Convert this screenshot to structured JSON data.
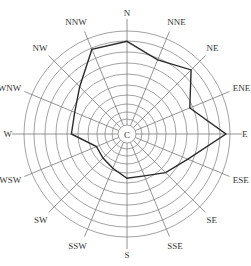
{
  "chart_data": {
    "type": "radar",
    "title": "",
    "subtype": "wind rose",
    "center_label": "C",
    "categories": [
      "N",
      "NNE",
      "NE",
      "ENE",
      "E",
      "ESE",
      "SE",
      "SSE",
      "S",
      "SSW",
      "SW",
      "WSW",
      "W",
      "WNW",
      "NW",
      "NNW"
    ],
    "series": [
      {
        "name": "wind frequency",
        "values": [
          9.0,
          7.8,
          8.8,
          6.6,
          9.6,
          6.4,
          5.3,
          4.4,
          4.3,
          3.6,
          3.3,
          3.2,
          5.4,
          5.5,
          6.5,
          8.9
        ]
      }
    ],
    "rings": 10,
    "rmax": 10,
    "grid": true,
    "legend": false,
    "ring_radii_px": [
      9,
      15,
      22,
      30,
      39,
      49,
      60,
      71,
      82,
      93,
      103
    ]
  },
  "colors": {
    "grid": "#8a8a8a",
    "series": "#2a2a2a",
    "text": "#333333",
    "background": "#ffffff"
  }
}
